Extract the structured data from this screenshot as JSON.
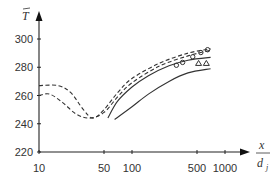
{
  "chart_data": {
    "type": "line",
    "title": "",
    "ylabel": "T̄",
    "xlabel": "x / d_j",
    "x_scale": "log",
    "xlim": [
      10,
      1500
    ],
    "ylim": [
      220,
      310
    ],
    "x_ticks": [
      "10",
      "50",
      "100",
      "500",
      "1000"
    ],
    "y_ticks": [
      "220",
      "240",
      "260",
      "280",
      "300"
    ],
    "grid": false,
    "legend": null,
    "series": [
      {
        "name": "dashed-upper",
        "style": "dashed",
        "x": [
          10,
          16,
          22,
          30,
          38,
          50,
          70,
          100,
          200,
          400,
          700
        ],
        "y": [
          267,
          267,
          262,
          250,
          244,
          250,
          262,
          272,
          283,
          290,
          293
        ]
      },
      {
        "name": "dashed-lower",
        "style": "dashed",
        "x": [
          10,
          13,
          18,
          25,
          35,
          50,
          70,
          100,
          200,
          400,
          700
        ],
        "y": [
          260,
          261,
          255,
          247,
          244,
          248,
          259,
          269,
          281,
          288,
          292
        ]
      },
      {
        "name": "solid-upper",
        "style": "solid",
        "x": [
          55,
          70,
          100,
          150,
          250,
          400,
          700
        ],
        "y": [
          244,
          256,
          266,
          274,
          281,
          285,
          287
        ]
      },
      {
        "name": "solid-lower",
        "style": "solid",
        "x": [
          65,
          100,
          150,
          250,
          400,
          700
        ],
        "y": [
          243,
          252,
          261,
          270,
          276,
          279
        ]
      },
      {
        "name": "circles",
        "style": "marker-circle",
        "x": [
          300,
          350,
          450,
          550,
          650
        ],
        "y": [
          280,
          282,
          286,
          289,
          291
        ]
      },
      {
        "name": "triangles",
        "style": "marker-triangle",
        "x": [
          520,
          630
        ],
        "y": [
          282,
          282
        ]
      }
    ]
  }
}
